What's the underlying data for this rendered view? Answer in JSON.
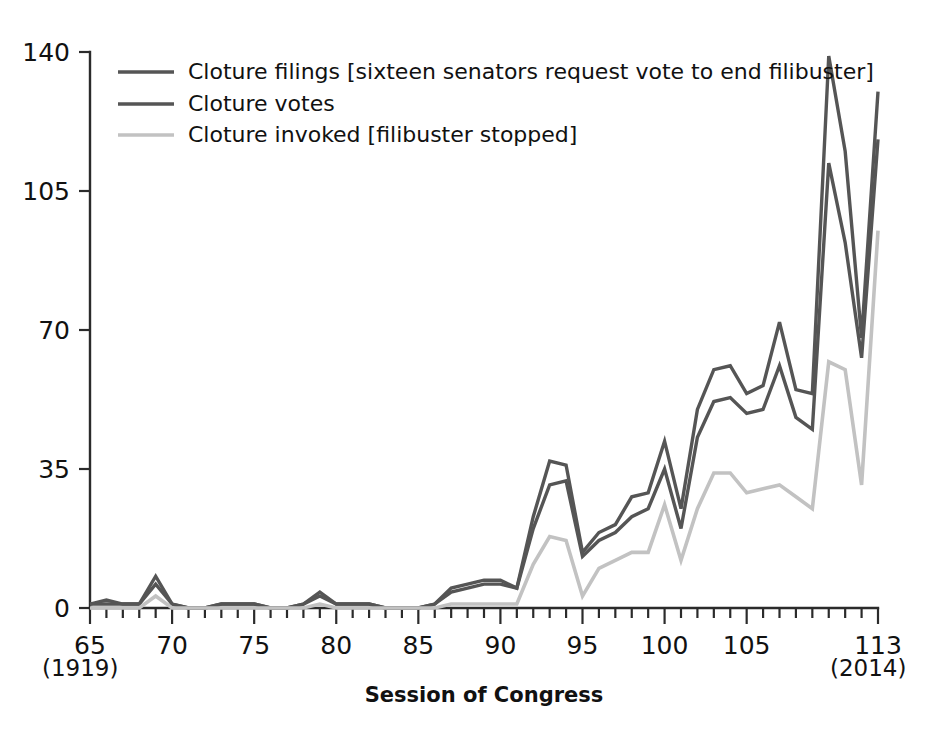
{
  "chart_data": {
    "type": "line",
    "title": "",
    "xlabel": "Session of Congress",
    "ylabel": "",
    "xlim": [
      65,
      113
    ],
    "ylim": [
      0,
      140
    ],
    "grid": false,
    "legend_position": "top-left",
    "x_tick_labels": [
      "65",
      "70",
      "75",
      "80",
      "85",
      "90",
      "95",
      "100",
      "105",
      "113"
    ],
    "x_tick_values": [
      65,
      70,
      75,
      80,
      85,
      90,
      95,
      100,
      105,
      113
    ],
    "x_minor_tick_step": 1,
    "y_tick_labels": [
      "0",
      "35",
      "70",
      "105",
      "140"
    ],
    "y_tick_values": [
      0,
      35,
      70,
      105,
      140
    ],
    "x_range_start_annotation": "(1919)",
    "x_range_end_annotation": "(2014)",
    "x": [
      65,
      66,
      67,
      68,
      69,
      70,
      71,
      72,
      73,
      74,
      75,
      76,
      77,
      78,
      79,
      80,
      81,
      82,
      83,
      84,
      85,
      86,
      87,
      88,
      89,
      90,
      91,
      92,
      93,
      94,
      95,
      96,
      97,
      98,
      99,
      100,
      101,
      102,
      103,
      104,
      105,
      106,
      107,
      108,
      109,
      110,
      111,
      112,
      113
    ],
    "series": [
      {
        "name": "Cloture filings [sixteen senators request vote to end filibuster]",
        "color": "#555555",
        "values": [
          1,
          2,
          1,
          1,
          8,
          1,
          0,
          0,
          1,
          1,
          1,
          0,
          0,
          1,
          4,
          1,
          1,
          1,
          0,
          0,
          0,
          1,
          5,
          6,
          7,
          7,
          5,
          23,
          37,
          36,
          14,
          19,
          21,
          28,
          29,
          42,
          25,
          50,
          60,
          61,
          54,
          56,
          72,
          55,
          54,
          139,
          115,
          68,
          130
        ]
      },
      {
        "name": "Cloture votes",
        "color": "#555555",
        "values": [
          1,
          1,
          1,
          1,
          6,
          1,
          0,
          0,
          1,
          1,
          1,
          0,
          0,
          1,
          3,
          1,
          1,
          1,
          0,
          0,
          0,
          1,
          4,
          5,
          6,
          6,
          5,
          20,
          31,
          32,
          13,
          17,
          19,
          23,
          25,
          35,
          20,
          43,
          52,
          53,
          49,
          50,
          61,
          48,
          45,
          112,
          92,
          63,
          118
        ]
      },
      {
        "name": "Cloture invoked [filibuster stopped]",
        "color": "#c2c2c2",
        "values": [
          0,
          0,
          0,
          0,
          3,
          0,
          0,
          0,
          0,
          0,
          0,
          0,
          0,
          0,
          1,
          0,
          0,
          0,
          0,
          0,
          0,
          0,
          1,
          1,
          1,
          1,
          1,
          11,
          18,
          17,
          3,
          10,
          12,
          14,
          14,
          26,
          12,
          25,
          34,
          34,
          29,
          30,
          31,
          28,
          25,
          62,
          60,
          31,
          95
        ]
      }
    ]
  },
  "legend": {
    "items": [
      {
        "label": "Cloture filings [sixteen senators request vote to end filibuster]",
        "color": "#555555"
      },
      {
        "label": "Cloture votes",
        "color": "#555555"
      },
      {
        "label": "Cloture invoked [filibuster stopped]",
        "color": "#c2c2c2"
      }
    ]
  }
}
